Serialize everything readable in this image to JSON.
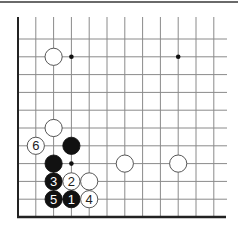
{
  "diagram": {
    "type": "go-board-partial",
    "corner": "bottom-left",
    "grid": {
      "columns_visible": 12,
      "rows_visible": 11,
      "origin_x": 18,
      "origin_y": 217,
      "spacing": 17.8,
      "line_extend_right": 227,
      "line_extend_top": 17,
      "line_color": "#8a8a8a",
      "edge_color": "#222222"
    },
    "star_points": [
      {
        "col": 3,
        "row": 9
      },
      {
        "col": 9,
        "row": 9
      },
      {
        "col": 3,
        "row": 3
      }
    ],
    "stones": [
      {
        "color": "white",
        "col": 2,
        "row": 9,
        "label": ""
      },
      {
        "color": "white",
        "col": 2,
        "row": 5,
        "label": ""
      },
      {
        "color": "white",
        "col": 1,
        "row": 4,
        "label": "6"
      },
      {
        "color": "black",
        "col": 3,
        "row": 4,
        "label": ""
      },
      {
        "color": "black",
        "col": 2,
        "row": 3,
        "label": ""
      },
      {
        "color": "white",
        "col": 6,
        "row": 3,
        "label": ""
      },
      {
        "color": "white",
        "col": 9,
        "row": 3,
        "label": ""
      },
      {
        "color": "black",
        "col": 2,
        "row": 2,
        "label": "3"
      },
      {
        "color": "white",
        "col": 3,
        "row": 2,
        "label": "2"
      },
      {
        "color": "white",
        "col": 4,
        "row": 2,
        "label": ""
      },
      {
        "color": "black",
        "col": 2,
        "row": 1,
        "label": "5"
      },
      {
        "color": "black",
        "col": 3,
        "row": 1,
        "label": "1"
      },
      {
        "color": "white",
        "col": 4,
        "row": 1,
        "label": "4"
      }
    ],
    "colors": {
      "black_stone": "#111111",
      "white_stone": "#ffffff",
      "stone_outline": "#444444",
      "black_label": "#ffffff",
      "white_label": "#222222"
    }
  }
}
